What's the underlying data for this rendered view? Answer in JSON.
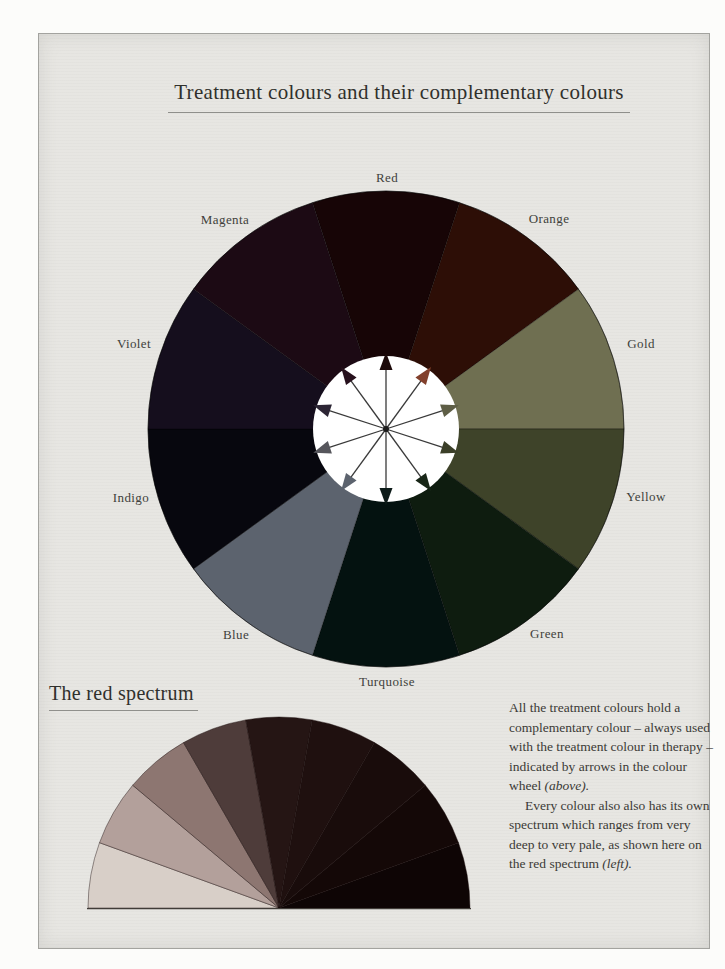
{
  "page": {
    "title": "Treatment colours and their complementary colours"
  },
  "wheel": {
    "segments": [
      {
        "name": "Red",
        "color": "#170506",
        "arrow_color": "#1d0a0a"
      },
      {
        "name": "Orange",
        "color": "#2d0e06",
        "arrow_color": "#82402c"
      },
      {
        "name": "Gold",
        "color": "#6f6f51",
        "arrow_color": "#5e5e46"
      },
      {
        "name": "Yellow",
        "color": "#3e4329",
        "arrow_color": "#3b3f28"
      },
      {
        "name": "Green",
        "color": "#0e1c0f",
        "arrow_color": "#182617"
      },
      {
        "name": "Turquoise",
        "color": "#041210",
        "arrow_color": "#0d1b19"
      },
      {
        "name": "Blue",
        "color": "#5c636e",
        "arrow_color": "#5c636e"
      },
      {
        "name": "Indigo",
        "color": "#07070e",
        "arrow_color": "#56565c"
      },
      {
        "name": "Violet",
        "color": "#150e1d",
        "arrow_color": "#2c2534"
      },
      {
        "name": "Magenta",
        "color": "#1c0a14",
        "arrow_color": "#27111d"
      }
    ],
    "inner_circle_color": "#ffffff",
    "arrow_line_color": "#3a3a3a",
    "complementary_pairs": [
      [
        "Red",
        "Turquoise"
      ],
      [
        "Orange",
        "Blue"
      ],
      [
        "Gold",
        "Indigo"
      ],
      [
        "Yellow",
        "Violet"
      ],
      [
        "Green",
        "Magenta"
      ]
    ]
  },
  "spectrum": {
    "heading": "The red spectrum",
    "wedges_pale_to_deep": [
      "#d8cfc8",
      "#b3a09b",
      "#8d7671",
      "#4e3c3a",
      "#251514",
      "#1f100f",
      "#190c0b",
      "#140807",
      "#0e0505"
    ]
  },
  "note": {
    "para1": "All the treatment colours hold a complementary colour – always used with the treatment colour in therapy – indicated by arrows in the colour wheel ",
    "para1_italic": "(above).",
    "para2": "Every colour also also has its own spectrum which ranges from very deep to very pale, as shown here on the red spectrum ",
    "para2_italic": "(left)."
  }
}
